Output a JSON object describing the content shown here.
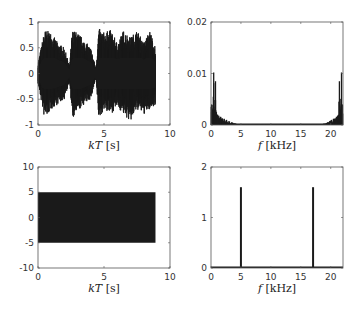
{
  "chart_data": [
    {
      "id": "time-signal-top",
      "type": "line",
      "title": "",
      "xlabel": "kT [s]",
      "ylabel": "",
      "xlim": [
        0,
        10
      ],
      "ylim": [
        -1,
        1
      ],
      "xticks": [
        "0",
        "5",
        "10"
      ],
      "yticks": [
        "1",
        "0.5",
        "0",
        "-0.5",
        "-1"
      ],
      "description": "Dense audio-like waveform from 0 to ~8.9 s with bursty envelope peaking near ±0.9",
      "envelope": {
        "t": [
          0,
          0.5,
          1.0,
          1.5,
          2.0,
          2.4,
          2.6,
          3.0,
          3.5,
          4.0,
          4.4,
          4.6,
          5.0,
          5.5,
          6.0,
          6.5,
          7.0,
          7.5,
          8.0,
          8.5,
          8.9
        ],
        "upper": [
          0.2,
          0.85,
          0.8,
          0.6,
          0.5,
          0.15,
          0.85,
          0.8,
          0.65,
          0.5,
          0.1,
          0.88,
          0.8,
          0.85,
          0.6,
          0.85,
          0.7,
          0.85,
          0.6,
          0.85,
          0.5
        ],
        "lower": [
          -0.2,
          -0.9,
          -0.7,
          -0.6,
          -0.5,
          -0.15,
          -0.9,
          -0.75,
          -0.6,
          -0.5,
          -0.1,
          -0.9,
          -0.7,
          -0.8,
          -0.65,
          -0.8,
          -0.95,
          -0.7,
          -0.8,
          -0.7,
          -0.6
        ]
      },
      "grid": false
    },
    {
      "id": "spectrum-top",
      "type": "bar",
      "title": "",
      "xlabel": "f [kHz]",
      "ylabel": "",
      "xlim": [
        0,
        22.05
      ],
      "ylim": [
        0,
        0.02
      ],
      "xticks": [
        "0",
        "5",
        "10",
        "15",
        "20"
      ],
      "yticks": [
        "0.02",
        "0.01",
        "0"
      ],
      "x": [
        0.1,
        0.25,
        0.45,
        0.6,
        0.75,
        0.9,
        1.1,
        1.3,
        1.6,
        1.9,
        2.2,
        2.6,
        3.0,
        3.5,
        4.0,
        4.5,
        5.0,
        18.05,
        18.55,
        19.05,
        19.45,
        19.85,
        20.15,
        20.45,
        20.75,
        20.95,
        21.15,
        21.3,
        21.45,
        21.6,
        21.8,
        21.95
      ],
      "values": [
        0.004,
        0.003,
        0.0102,
        0.003,
        0.0085,
        0.0025,
        0.002,
        0.0018,
        0.0016,
        0.0013,
        0.0012,
        0.001,
        0.0008,
        0.0005,
        0.0003,
        0.0002,
        0.0001,
        0.0001,
        0.0002,
        0.0003,
        0.0005,
        0.0008,
        0.001,
        0.0012,
        0.0013,
        0.0016,
        0.0018,
        0.002,
        0.0085,
        0.003,
        0.0102,
        0.004
      ],
      "grid": false
    },
    {
      "id": "time-signal-bottom",
      "type": "line",
      "title": "",
      "xlabel": "kT [s]",
      "ylabel": "",
      "xlim": [
        0,
        10
      ],
      "ylim": [
        -10,
        10
      ],
      "xticks": [
        "0",
        "5",
        "10"
      ],
      "yticks": [
        "10",
        "5",
        "0",
        "-5",
        "-10"
      ],
      "description": "Constant-amplitude sinusoid (±5) from 0 to ~8.9 s, appears as solid block",
      "envelope": {
        "t": [
          0,
          8.9
        ],
        "upper": [
          5,
          5
        ],
        "lower": [
          -5,
          -5
        ]
      },
      "grid": false
    },
    {
      "id": "spectrum-bottom",
      "type": "bar",
      "title": "",
      "xlabel": "f [kHz]",
      "ylabel": "",
      "xlim": [
        0,
        22.05
      ],
      "ylim": [
        0,
        2
      ],
      "xticks": [
        "0",
        "5",
        "10",
        "15",
        "20"
      ],
      "yticks": [
        "2",
        "1",
        "0"
      ],
      "x": [
        5,
        17.05
      ],
      "values": [
        1.6,
        1.6
      ],
      "grid": false
    }
  ],
  "colors": {
    "line": "#1a1a1a",
    "axis": "#555555",
    "background": "#ffffff"
  }
}
